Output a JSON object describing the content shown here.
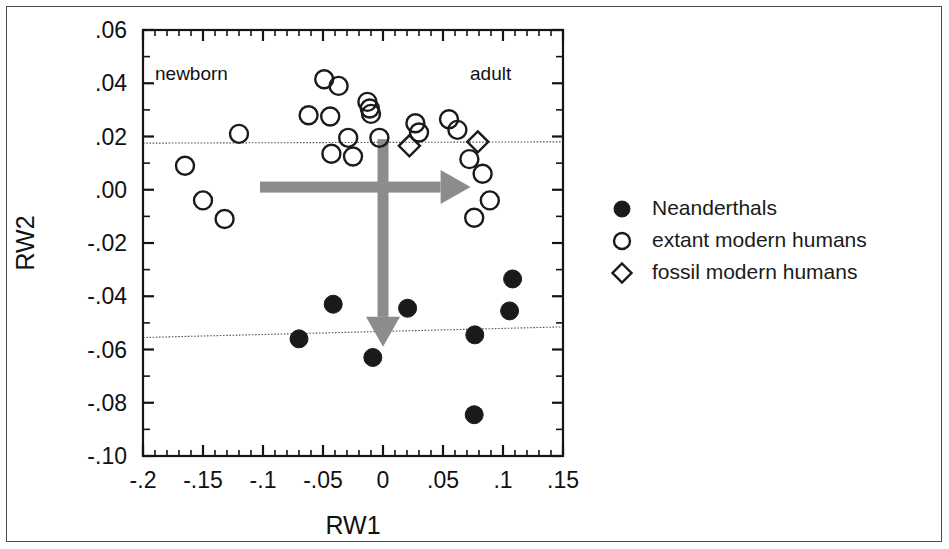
{
  "figure": {
    "background": "#ffffff",
    "border_color": "#4a4a4a",
    "marker_color": "#1a1a1a",
    "arrow_color": "#8c8c8c"
  },
  "annotations": {
    "newborn": "newborn",
    "adult": "adult"
  },
  "legend": {
    "items": [
      {
        "symbol": "filled-circle",
        "label": "Neanderthals"
      },
      {
        "symbol": "open-circle",
        "label": "extant modern humans"
      },
      {
        "symbol": "open-diamond",
        "label": "fossil modern humans"
      }
    ]
  },
  "chart_data": {
    "type": "scatter",
    "title": "",
    "xlabel": "RW1",
    "ylabel": "RW2",
    "xlim": [
      -0.2,
      0.15
    ],
    "ylim": [
      -0.1,
      0.06
    ],
    "xticks": [
      -0.2,
      -0.15,
      -0.1,
      -0.05,
      0,
      0.05,
      0.1,
      0.15
    ],
    "xtick_labels": [
      "-.2",
      "-.15",
      "-.1",
      "-.05",
      "0",
      ".05",
      ".1",
      ".15"
    ],
    "yticks": [
      0.06,
      0.04,
      0.02,
      0.0,
      -0.02,
      -0.04,
      -0.06,
      -0.08,
      -0.1
    ],
    "ytick_labels": [
      ".06",
      ".04",
      ".02",
      ".00",
      "-.02",
      "-.04",
      "-.06",
      "-.08",
      "-.10"
    ],
    "minor_ticks_per_interval": 5,
    "grid": false,
    "legend_position": "right-outside",
    "series": [
      {
        "name": "extant modern humans",
        "symbol": "open-circle",
        "points": [
          [
            -0.12,
            0.021
          ],
          [
            -0.165,
            0.009
          ],
          [
            -0.15,
            -0.004
          ],
          [
            -0.132,
            -0.011
          ],
          [
            -0.049,
            0.0415
          ],
          [
            -0.037,
            0.039
          ],
          [
            -0.062,
            0.028
          ],
          [
            -0.044,
            0.0275
          ],
          [
            -0.013,
            0.033
          ],
          [
            -0.011,
            0.0305
          ],
          [
            -0.01,
            0.0285
          ],
          [
            -0.029,
            0.0195
          ],
          [
            -0.043,
            0.0135
          ],
          [
            -0.025,
            0.0125
          ],
          [
            -0.003,
            0.0195
          ],
          [
            0.027,
            0.025
          ],
          [
            0.03,
            0.0215
          ],
          [
            0.055,
            0.0265
          ],
          [
            0.062,
            0.0225
          ],
          [
            0.072,
            0.0115
          ],
          [
            0.083,
            0.006
          ],
          [
            0.089,
            -0.004
          ],
          [
            0.076,
            -0.0105
          ]
        ]
      },
      {
        "name": "fossil modern humans",
        "symbol": "open-diamond",
        "points": [
          [
            0.022,
            0.0165
          ],
          [
            0.079,
            0.018
          ]
        ]
      },
      {
        "name": "Neanderthals",
        "symbol": "filled-circle",
        "points": [
          [
            -0.07,
            -0.056
          ],
          [
            -0.0415,
            -0.043
          ],
          [
            -0.0085,
            -0.063
          ],
          [
            0.0205,
            -0.0445
          ],
          [
            0.0765,
            -0.0545
          ],
          [
            0.076,
            -0.0845
          ],
          [
            0.108,
            -0.0335
          ],
          [
            0.1055,
            -0.0455
          ]
        ]
      }
    ],
    "reference_lines": [
      {
        "name": "modern-human-mean-line",
        "style": "dotted",
        "from": [
          -0.2,
          0.0175
        ],
        "to": [
          0.15,
          0.018
        ]
      },
      {
        "name": "neanderthal-mean-line",
        "style": "dotted",
        "from": [
          -0.2,
          -0.0555
        ],
        "to": [
          0.15,
          -0.0515
        ]
      }
    ],
    "arrows": [
      {
        "name": "ontogeny-horizontal-arrow",
        "direction": "right",
        "from": [
          -0.1025,
          0.001
        ],
        "to": [
          0.073,
          0.001
        ]
      },
      {
        "name": "ontogeny-vertical-arrow",
        "direction": "down",
        "from": [
          0.0,
          0.019
        ],
        "to": [
          0.0,
          -0.059
        ]
      }
    ]
  }
}
